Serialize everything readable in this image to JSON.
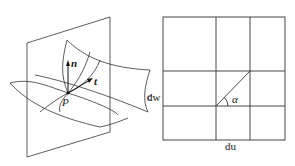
{
  "left_figure": {
    "normal_label": "n",
    "tangent_label": "t",
    "point_label": "P",
    "side_label": "c"
  },
  "right_figure": {
    "vertical_label": "dw",
    "horizontal_label": "du",
    "angle_label": "α"
  }
}
